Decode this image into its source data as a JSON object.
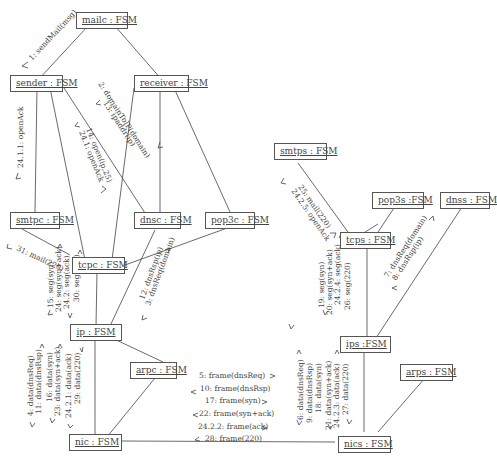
{
  "nodes": {
    "mailc": "mailc : FSM",
    "sender": "sender : FSM",
    "receiver": "receiver : FSM",
    "smtpc": "smtpc : FSM",
    "dnsc": "dnsc : FSM",
    "pop3c": "pop3c : FSM",
    "tcpc": "tcpc : FSM",
    "ip": "ip : FSM",
    "arpc": "arpc : FSM",
    "nic": "nic : FSM",
    "smtps": "smtps : FSM",
    "pop3s": "pop3s :FSM",
    "dnss": "dnss : FSM",
    "tcps": "tcps : FSM",
    "ips": "ips :FSM",
    "arps": "arps : FSM",
    "nics": "nics : FSM"
  },
  "messages": {
    "mailc_sender": [
      "1: sendMail(msg)"
    ],
    "sender_receiver": [
      "2: domainToIP(domain)",
      "13: ipaddr(ip)"
    ],
    "sender_smtpc": [
      "24.1.1: openAck"
    ],
    "sender_tcpc": [
      "14: open(ip,25)",
      "24.1: openAck"
    ],
    "smtpc_tcpc": [
      "31: mail(220)"
    ],
    "tcpc_ip": [
      "15: seg(syn)",
      "24: seg(syn+ack)",
      "24.2: seg(ack)",
      "30: seg(220)"
    ],
    "dnsc_ip": [
      "12: dnsRsp(ip)",
      "3: dnsReq(domain)"
    ],
    "ip_nic": [
      "4: data(dnsReq)",
      "11: data(dnsRsp)",
      "16: data(syn)",
      "23: data(syn+ack)",
      "24.2.1: data(ack)",
      "29: data(220)"
    ],
    "nic_nics": [
      "5: frame(dnsReq)",
      "10: frame(dnsRsp)",
      "17: frame(syn)",
      "22: frame(syn+ack)",
      "24.2.2: frame(ack)",
      "28: frame(220)"
    ],
    "nics_ips": [
      "6: data(dnsReq)",
      "9: data(dnsRsp)",
      "18: data(syn)",
      "21: data(syn+ack)",
      "24.2.3: data(ack)",
      "27: data(220)"
    ],
    "ips_tcps": [
      "19: seg(syn)",
      "20: seg(syn+ack)",
      "24.2.4: seg(ack)",
      "26: seg(220)"
    ],
    "smtps_tcps": [
      "25: mail(220)",
      "24.2.5: openAck"
    ],
    "ips_dnss": [
      "7: dnsReq(domain)",
      "8: dnsRsp(ip)"
    ]
  }
}
